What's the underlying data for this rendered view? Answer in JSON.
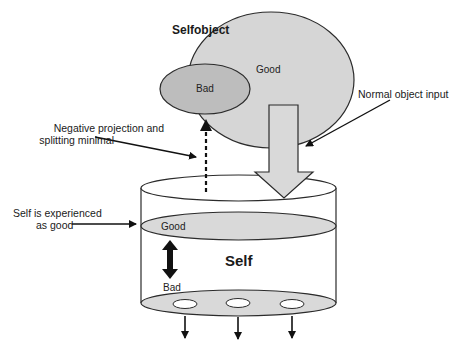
{
  "diagram": {
    "selfobject_label": "Selfobject",
    "good_object_label": "Good",
    "bad_object_label": "Bad",
    "normal_input_label": "Normal object input",
    "negative_projection_label_line1": "Negative projection and",
    "negative_projection_label_line2": "splitting minimal",
    "self_experienced_line1": "Self is experienced",
    "self_experienced_line2": "as good",
    "self_label": "Self",
    "self_good_label": "Good",
    "self_bad_label": "Bad",
    "outflow_holes": 3,
    "colors": {
      "good_fill": "#d6d6d6",
      "bad_fill": "#bdbdbd",
      "stroke": "#2b2b2b",
      "level_fill": "#d9d9d9",
      "arrow_fill": "#d9d9d9"
    }
  }
}
